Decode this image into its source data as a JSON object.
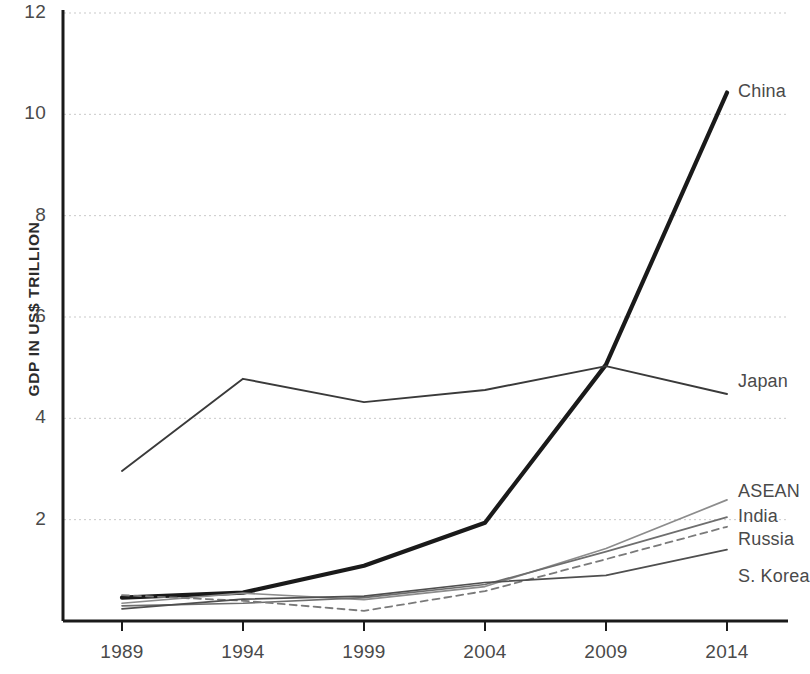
{
  "chart_data": {
    "type": "line",
    "title": "",
    "subtitle": "",
    "xlabel": "",
    "ylabel": "GDP IN US$ TRILLION",
    "x": [
      1989,
      1994,
      1999,
      2004,
      2009,
      2014
    ],
    "xtick_labels": [
      "1989",
      "1994",
      "1999",
      "2004",
      "2009",
      "2014"
    ],
    "ytick_labels": [
      "12",
      "10",
      "8",
      "6",
      "4",
      "2"
    ],
    "ytick_values": [
      12,
      10,
      8,
      6,
      4,
      2
    ],
    "xlim": [
      1989,
      2014
    ],
    "ylim": [
      0,
      12
    ],
    "grid": "horizontal-dotted",
    "legend_position": "right-inline-labels",
    "series": [
      {
        "name": "China",
        "label": "China",
        "values": [
          0.46,
          0.56,
          1.09,
          1.94,
          5.06,
          10.43
        ],
        "color": "#1a1a1a",
        "width": 4.2,
        "dash": "none",
        "label_y": 93
      },
      {
        "name": "Japan",
        "label": "Japan",
        "values": [
          2.96,
          4.78,
          4.32,
          4.56,
          5.03,
          4.48
        ],
        "color": "#3a3a3a",
        "width": 1.9,
        "dash": "none",
        "label_y": 383
      },
      {
        "name": "ASEAN",
        "label": "ASEAN",
        "values": [
          0.35,
          0.55,
          0.42,
          0.68,
          1.43,
          2.39
        ],
        "color": "#8c8c8c",
        "width": 1.7,
        "dash": "none",
        "label_y": 493
      },
      {
        "name": "India",
        "label": "India",
        "values": [
          0.3,
          0.35,
          0.46,
          0.72,
          1.37,
          2.05
        ],
        "color": "#6e6e6e",
        "width": 1.7,
        "dash": "none",
        "label_y": 518
      },
      {
        "name": "Russia",
        "label": "Russia",
        "values": [
          0.51,
          0.4,
          0.2,
          0.59,
          1.22,
          1.86
        ],
        "color": "#7a7a7a",
        "width": 1.8,
        "dash": "dashed",
        "label_y": 541
      },
      {
        "name": "S. Korea",
        "label": "S. Korea",
        "values": [
          0.24,
          0.43,
          0.49,
          0.76,
          0.9,
          1.41
        ],
        "color": "#4f4f4f",
        "width": 1.7,
        "dash": "none",
        "label_y": 578
      }
    ]
  }
}
